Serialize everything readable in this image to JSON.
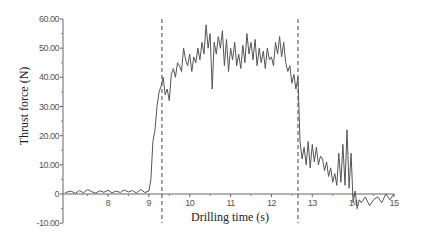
{
  "chart_data": {
    "type": "line",
    "title": "",
    "xlabel": "Drilling time (s)",
    "ylabel": "Thrust force (N)",
    "xlim": [
      7.0,
      15.0
    ],
    "ylim": [
      -10.0,
      60.0
    ],
    "x_ticks": [
      8,
      9,
      10,
      11,
      12,
      13,
      14,
      15
    ],
    "x_tick_labels": [
      "8",
      "9",
      "10",
      "11",
      "12",
      "13",
      "14",
      "15"
    ],
    "y_ticks": [
      -10,
      0,
      10,
      20,
      30,
      40,
      50,
      60
    ],
    "y_tick_labels": [
      "-10.00",
      "0",
      "10.00",
      "20.00",
      "30.00",
      "40.00",
      "50.00",
      "60.00"
    ],
    "grid": false,
    "legend": "none",
    "vertical_markers": [
      {
        "x": 9.32,
        "style": "dashed"
      },
      {
        "x": 12.65,
        "style": "dashed"
      }
    ],
    "series": [
      {
        "name": "Thrust force",
        "color": "#555555",
        "x": [
          6.95,
          7.1,
          7.2,
          7.3,
          7.4,
          7.5,
          7.6,
          7.7,
          7.8,
          7.9,
          8.0,
          8.1,
          8.2,
          8.3,
          8.4,
          8.5,
          8.6,
          8.7,
          8.8,
          8.9,
          9.0,
          9.05,
          9.1,
          9.15,
          9.2,
          9.25,
          9.3,
          9.35,
          9.4,
          9.45,
          9.5,
          9.55,
          9.6,
          9.65,
          9.7,
          9.75,
          9.8,
          9.85,
          9.9,
          9.95,
          10.0,
          10.05,
          10.1,
          10.15,
          10.2,
          10.25,
          10.3,
          10.35,
          10.4,
          10.45,
          10.5,
          10.55,
          10.6,
          10.65,
          10.7,
          10.75,
          10.8,
          10.85,
          10.9,
          10.95,
          11.0,
          11.05,
          11.1,
          11.15,
          11.2,
          11.25,
          11.3,
          11.35,
          11.4,
          11.45,
          11.5,
          11.55,
          11.6,
          11.65,
          11.7,
          11.75,
          11.8,
          11.85,
          11.9,
          11.95,
          12.0,
          12.05,
          12.1,
          12.15,
          12.2,
          12.25,
          12.3,
          12.35,
          12.4,
          12.45,
          12.5,
          12.55,
          12.6,
          12.65,
          12.66,
          12.7,
          12.75,
          12.8,
          12.85,
          12.9,
          12.95,
          13.0,
          13.05,
          13.1,
          13.15,
          13.2,
          13.25,
          13.3,
          13.35,
          13.4,
          13.45,
          13.5,
          13.55,
          13.6,
          13.65,
          13.7,
          13.75,
          13.8,
          13.85,
          13.9,
          13.95,
          14.0,
          14.05,
          14.1,
          14.15,
          14.2,
          14.3,
          14.4,
          14.5,
          14.6,
          14.7,
          14.8,
          14.9,
          15.0
        ],
        "y": [
          0.5,
          1.0,
          0.2,
          1.2,
          0.4,
          1.5,
          0.8,
          0.3,
          1.1,
          0.6,
          1.3,
          0.4,
          1.0,
          0.5,
          1.4,
          0.7,
          1.2,
          0.3,
          1.6,
          0.5,
          1.0,
          5.0,
          18.0,
          22.0,
          30.0,
          35.0,
          37.0,
          40.0,
          34.0,
          36.0,
          32.0,
          41.0,
          43.0,
          40.0,
          45.0,
          44.0,
          42.0,
          50.0,
          46.0,
          44.0,
          48.0,
          42.0,
          47.0,
          45.0,
          50.0,
          46.0,
          52.0,
          48.0,
          58.0,
          50.0,
          55.0,
          36.0,
          52.0,
          48.0,
          54.0,
          50.0,
          56.0,
          44.0,
          53.0,
          42.0,
          50.0,
          46.0,
          52.0,
          44.0,
          48.0,
          43.0,
          51.0,
          45.0,
          55.0,
          48.0,
          52.0,
          46.0,
          53.0,
          44.0,
          50.0,
          45.0,
          49.0,
          43.0,
          50.0,
          46.0,
          47.0,
          44.0,
          52.0,
          48.0,
          54.0,
          47.0,
          52.0,
          45.0,
          42.0,
          44.0,
          38.0,
          41.0,
          36.0,
          40.0,
          35.0,
          18.0,
          12.0,
          16.0,
          10.0,
          18.0,
          9.0,
          17.0,
          11.0,
          16.0,
          10.0,
          13.0,
          12.0,
          8.0,
          11.0,
          6.0,
          9.0,
          4.0,
          7.0,
          3.0,
          14.0,
          4.0,
          17.0,
          3.0,
          22.0,
          2.0,
          14.0,
          -3.0,
          1.0,
          -5.0,
          -2.0,
          -3.0,
          -1.0,
          -4.0,
          -2.0,
          -1.0,
          -3.0,
          0.0,
          -2.0,
          0.0
        ]
      }
    ]
  }
}
